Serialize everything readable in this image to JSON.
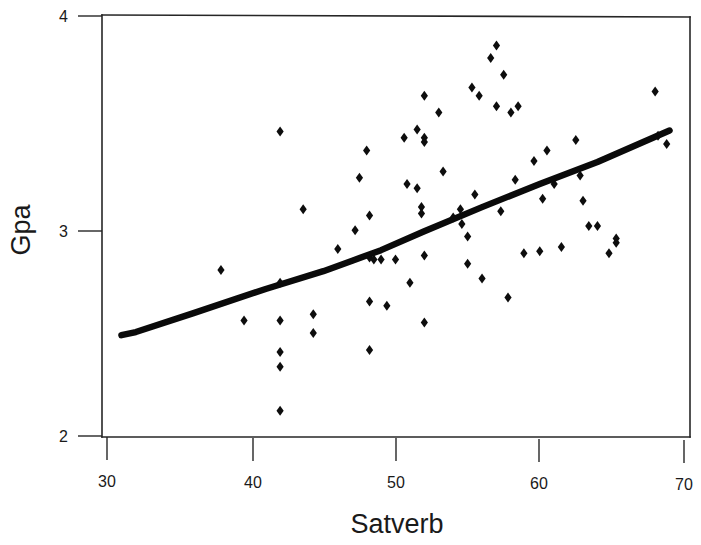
{
  "chart_data": {
    "type": "scatter",
    "title": "",
    "xlabel": "Satverb",
    "ylabel": "Gpa",
    "xlim": [
      30,
      70
    ],
    "ylim": [
      2,
      4
    ],
    "xticks": [
      30,
      40,
      50,
      60,
      70
    ],
    "yticks": [
      2,
      3,
      4
    ],
    "xtick_labels": [
      "30",
      "40",
      "50",
      "60",
      "70"
    ],
    "ytick_labels": [
      "2",
      "3",
      "4"
    ],
    "grid": false,
    "legend": null,
    "marker": "diamond",
    "marker_color": "#0d0d0d",
    "line_color": "#0a0a0a",
    "points": [
      [
        37.9,
        2.79
      ],
      [
        39.5,
        2.55
      ],
      [
        42.0,
        3.45
      ],
      [
        42.0,
        2.73
      ],
      [
        42.0,
        2.55
      ],
      [
        42.0,
        2.4
      ],
      [
        42.0,
        2.33
      ],
      [
        42.0,
        2.12
      ],
      [
        43.6,
        3.08
      ],
      [
        44.3,
        2.58
      ],
      [
        44.3,
        2.49
      ],
      [
        46.0,
        2.89
      ],
      [
        47.2,
        2.98
      ],
      [
        47.5,
        3.23
      ],
      [
        48.0,
        3.36
      ],
      [
        48.2,
        3.05
      ],
      [
        48.2,
        2.85
      ],
      [
        48.2,
        2.64
      ],
      [
        48.2,
        2.41
      ],
      [
        48.5,
        2.84
      ],
      [
        49.0,
        2.84
      ],
      [
        49.4,
        2.62
      ],
      [
        50.0,
        2.84
      ],
      [
        50.6,
        3.42
      ],
      [
        50.8,
        3.2
      ],
      [
        51.0,
        2.73
      ],
      [
        51.5,
        3.46
      ],
      [
        51.5,
        3.18
      ],
      [
        51.8,
        3.09
      ],
      [
        51.8,
        3.06
      ],
      [
        52.0,
        3.62
      ],
      [
        52.0,
        3.42
      ],
      [
        52.0,
        3.4
      ],
      [
        52.0,
        2.86
      ],
      [
        52.0,
        2.54
      ],
      [
        53.0,
        3.54
      ],
      [
        53.3,
        3.26
      ],
      [
        54.0,
        3.04
      ],
      [
        54.5,
        3.08
      ],
      [
        54.6,
        3.01
      ],
      [
        55.0,
        2.95
      ],
      [
        55.0,
        2.82
      ],
      [
        55.3,
        3.66
      ],
      [
        55.5,
        3.15
      ],
      [
        55.8,
        3.62
      ],
      [
        56.0,
        2.75
      ],
      [
        56.6,
        3.8
      ],
      [
        57.0,
        3.86
      ],
      [
        57.0,
        3.57
      ],
      [
        57.3,
        3.07
      ],
      [
        57.5,
        3.72
      ],
      [
        57.8,
        2.66
      ],
      [
        58.0,
        3.54
      ],
      [
        58.3,
        3.22
      ],
      [
        58.5,
        3.57
      ],
      [
        58.9,
        2.87
      ],
      [
        59.6,
        3.31
      ],
      [
        60.0,
        2.88
      ],
      [
        60.2,
        3.13
      ],
      [
        60.5,
        3.36
      ],
      [
        61.0,
        3.2
      ],
      [
        61.5,
        2.9
      ],
      [
        62.5,
        3.41
      ],
      [
        62.8,
        3.24
      ],
      [
        63.0,
        3.12
      ],
      [
        63.4,
        3.0
      ],
      [
        64.0,
        3.0
      ],
      [
        64.8,
        2.87
      ],
      [
        65.3,
        2.92
      ],
      [
        65.3,
        2.94
      ],
      [
        68.0,
        3.64
      ],
      [
        68.2,
        3.43
      ],
      [
        68.8,
        3.39
      ]
    ],
    "trendline": {
      "label": "fitted line",
      "x": [
        31.0,
        32.0,
        36.0,
        41.0,
        45.0,
        47.0,
        49.0,
        52.0,
        56.0,
        60.0,
        64.0,
        69.0
      ],
      "y": [
        2.48,
        2.495,
        2.585,
        2.7,
        2.785,
        2.835,
        2.885,
        2.975,
        3.09,
        3.2,
        3.305,
        3.455
      ]
    }
  },
  "figure": {
    "background": "#ffffff",
    "axis_color": "#262626",
    "text_color": "#1a1a1a"
  }
}
